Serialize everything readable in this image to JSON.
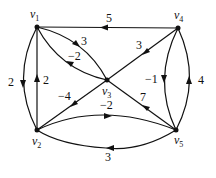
{
  "diagram": {
    "type": "directed-weighted-graph",
    "nodes": [
      {
        "id": "v1",
        "label": "v",
        "sub": "1",
        "x": 37,
        "y": 27
      },
      {
        "id": "v4",
        "label": "v",
        "sub": "4",
        "x": 178,
        "y": 28
      },
      {
        "id": "v3",
        "label": "v",
        "sub": "3",
        "x": 107,
        "y": 80
      },
      {
        "id": "v2",
        "label": "v",
        "sub": "2",
        "x": 37,
        "y": 130
      },
      {
        "id": "v5",
        "label": "v",
        "sub": "5",
        "x": 176,
        "y": 130
      }
    ],
    "edges": [
      {
        "from": "v4",
        "to": "v1",
        "weight": "5"
      },
      {
        "from": "v1",
        "to": "v3",
        "weight": "3"
      },
      {
        "from": "v3",
        "to": "v1",
        "weight": "−2"
      },
      {
        "from": "v4",
        "to": "v3",
        "weight": "3"
      },
      {
        "from": "v3",
        "to": "v2",
        "weight": "−4"
      },
      {
        "from": "v5",
        "to": "v3",
        "weight": "7"
      },
      {
        "from": "v4",
        "to": "v5",
        "weight": "−1"
      },
      {
        "from": "v5",
        "to": "v4",
        "weight": "4"
      },
      {
        "from": "v1",
        "to": "v2",
        "weight": "2"
      },
      {
        "from": "v2",
        "to": "v1",
        "weight": "2"
      },
      {
        "from": "v2",
        "to": "v5",
        "weight": "−2"
      },
      {
        "from": "v5",
        "to": "v2",
        "weight": "3"
      }
    ]
  }
}
